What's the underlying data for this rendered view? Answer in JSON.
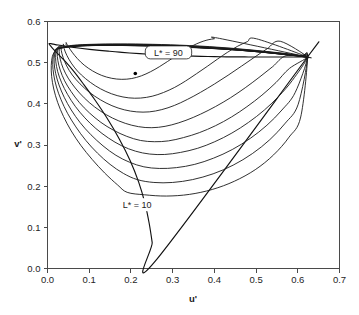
{
  "chart_data": {
    "type": "line",
    "title": "",
    "subtitle": "",
    "xlabel": "u'",
    "ylabel": "v'",
    "xlim": [
      0.0,
      0.7
    ],
    "ylim": [
      0.0,
      0.6
    ],
    "xticks": [
      "0.0",
      "0.1",
      "0.2",
      "0.3",
      "0.4",
      "0.5",
      "0.6",
      "0.7"
    ],
    "xtick_values": [
      0.0,
      0.1,
      0.2,
      0.3,
      0.4,
      0.5,
      0.6,
      0.7
    ],
    "yticks": [
      "0.0",
      "0.1",
      "0.2",
      "0.3",
      "0.4",
      "0.5",
      "0.6"
    ],
    "ytick_values": [
      0.0,
      0.1,
      0.2,
      0.3,
      0.4,
      0.5,
      0.6
    ],
    "grid": false,
    "legend_position": "none",
    "annotations": [
      {
        "name": "lstar-90-label",
        "text": "L* = 90",
        "x": 0.29,
        "y": 0.525,
        "boxed": true
      },
      {
        "name": "lstar-10-label",
        "text": "L* = 10",
        "x": 0.215,
        "y": 0.155,
        "boxed": false
      }
    ],
    "markers": [
      {
        "name": "white-point",
        "x": 0.2105,
        "y": 0.4737,
        "label": ""
      }
    ],
    "series": [
      {
        "name": "spectrum locus",
        "closed": true,
        "u": [
          0.2568,
          0.251,
          0.2436,
          0.2332,
          0.2184,
          0.198,
          0.1721,
          0.1426,
          0.1126,
          0.0852,
          0.0621,
          0.042,
          0.0255,
          0.0139,
          0.0074,
          0.0043,
          0.0041,
          0.0072,
          0.0142,
          0.0252,
          0.0399,
          0.0579,
          0.0785,
          0.1009,
          0.1244,
          0.1485,
          0.1728,
          0.197,
          0.2209,
          0.2443,
          0.2672,
          0.2893,
          0.3106,
          0.3309,
          0.3501,
          0.3681,
          0.3849,
          0.4005,
          0.415,
          0.4284,
          0.4408,
          0.4523,
          0.4629,
          0.4727,
          0.4818,
          0.4903,
          0.4982,
          0.5056,
          0.5125,
          0.519,
          0.5251,
          0.5309,
          0.5364,
          0.5416,
          0.5466,
          0.5514,
          0.556,
          0.5604,
          0.5647,
          0.5688,
          0.5728,
          0.5767,
          0.5805,
          0.5842,
          0.5878,
          0.5913,
          0.5948,
          0.5982,
          0.6015,
          0.6048,
          0.608,
          0.6111,
          0.6142,
          0.6172,
          0.6201,
          0.6229,
          0.6234
        ],
        "v": [
          0.016,
          0.0628,
          0.1105,
          0.16,
          0.2105,
          0.2625,
          0.3148,
          0.3656,
          0.4112,
          0.4494,
          0.48,
          0.5035,
          0.5208,
          0.5329,
          0.5406,
          0.5449,
          0.5466,
          0.5464,
          0.545,
          0.5429,
          0.5404,
          0.5377,
          0.535,
          0.5324,
          0.5299,
          0.5276,
          0.5255,
          0.5236,
          0.5219,
          0.5204,
          0.5191,
          0.518,
          0.5171,
          0.5164,
          0.5158,
          0.5153,
          0.5149,
          0.5146,
          0.5144,
          0.5142,
          0.5141,
          0.514,
          0.5139,
          0.5139,
          0.5138,
          0.5138,
          0.5138,
          0.5138,
          0.5138,
          0.5138,
          0.5138,
          0.5138,
          0.5138,
          0.5138,
          0.5138,
          0.5138,
          0.5138,
          0.5138,
          0.5138,
          0.5138,
          0.5138,
          0.5138,
          0.5138,
          0.5138,
          0.5138,
          0.5138,
          0.5138,
          0.5138,
          0.5138,
          0.5138,
          0.5138,
          0.5138,
          0.5138,
          0.5138,
          0.5138,
          0.5138,
          0.5138
        ]
      },
      {
        "name": "L* = 10",
        "level": 10,
        "closed": true,
        "u": [
          0.0184,
          0.0116,
          0.009,
          0.01,
          0.015,
          0.0245,
          0.0385,
          0.057,
          0.08,
          0.107,
          0.137,
          0.168,
          0.191,
          0.233,
          0.285,
          0.34,
          0.395,
          0.448,
          0.498,
          0.542,
          0.579,
          0.607,
          0.6234,
          0.61,
          0.574,
          0.528,
          0.476,
          0.42,
          0.364,
          0.308,
          0.256,
          0.208,
          0.165,
          0.128,
          0.096,
          0.069,
          0.047,
          0.03,
          0.0184
        ],
        "v": [
          0.53,
          0.515,
          0.493,
          0.466,
          0.436,
          0.403,
          0.369,
          0.334,
          0.299,
          0.265,
          0.232,
          0.203,
          0.185,
          0.179,
          0.176,
          0.18,
          0.192,
          0.212,
          0.24,
          0.276,
          0.319,
          0.368,
          0.5138,
          0.515,
          0.519,
          0.524,
          0.529,
          0.533,
          0.536,
          0.538,
          0.54,
          0.541,
          0.542,
          0.542,
          0.541,
          0.54,
          0.538,
          0.535,
          0.53
        ]
      },
      {
        "name": "L* = 20",
        "level": 20,
        "closed": true,
        "u": [
          0.02,
          0.014,
          0.0125,
          0.015,
          0.0215,
          0.0325,
          0.048,
          0.068,
          0.092,
          0.12,
          0.15,
          0.182,
          0.215,
          0.255,
          0.3,
          0.348,
          0.397,
          0.445,
          0.491,
          0.533,
          0.57,
          0.601,
          0.6234,
          0.606,
          0.567,
          0.52,
          0.468,
          0.413,
          0.358,
          0.304,
          0.253,
          0.206,
          0.164,
          0.128,
          0.097,
          0.071,
          0.05,
          0.033,
          0.02
        ],
        "v": [
          0.532,
          0.517,
          0.496,
          0.47,
          0.441,
          0.41,
          0.377,
          0.344,
          0.311,
          0.28,
          0.253,
          0.231,
          0.216,
          0.209,
          0.209,
          0.216,
          0.23,
          0.251,
          0.279,
          0.313,
          0.353,
          0.399,
          0.5138,
          0.5155,
          0.52,
          0.525,
          0.5295,
          0.5335,
          0.5365,
          0.539,
          0.5405,
          0.5415,
          0.542,
          0.542,
          0.5415,
          0.5405,
          0.5385,
          0.5355,
          0.532
        ]
      },
      {
        "name": "L* = 30",
        "level": 30,
        "closed": true,
        "u": [
          0.0218,
          0.0168,
          0.016,
          0.0195,
          0.0275,
          0.04,
          0.057,
          0.0785,
          0.104,
          0.133,
          0.164,
          0.197,
          0.231,
          0.268,
          0.309,
          0.353,
          0.398,
          0.443,
          0.486,
          0.526,
          0.562,
          0.594,
          0.6234,
          0.603,
          0.562,
          0.514,
          0.462,
          0.408,
          0.354,
          0.301,
          0.251,
          0.205,
          0.164,
          0.128,
          0.098,
          0.072,
          0.051,
          0.034,
          0.0218
        ],
        "v": [
          0.534,
          0.519,
          0.499,
          0.474,
          0.446,
          0.416,
          0.385,
          0.354,
          0.325,
          0.298,
          0.275,
          0.258,
          0.247,
          0.243,
          0.245,
          0.253,
          0.268,
          0.289,
          0.316,
          0.348,
          0.385,
          0.428,
          0.5138,
          0.516,
          0.5205,
          0.5255,
          0.53,
          0.534,
          0.537,
          0.5392,
          0.5408,
          0.5418,
          0.5422,
          0.5422,
          0.5418,
          0.5406,
          0.5388,
          0.536,
          0.534
        ]
      },
      {
        "name": "L* = 40",
        "level": 40,
        "closed": true,
        "u": [
          0.024,
          0.0198,
          0.02,
          0.0245,
          0.034,
          0.048,
          0.0665,
          0.0895,
          0.116,
          0.146,
          0.178,
          0.211,
          0.245,
          0.281,
          0.319,
          0.36,
          0.401,
          0.442,
          0.482,
          0.52,
          0.555,
          0.587,
          0.6234,
          0.6005,
          0.558,
          0.509,
          0.458,
          0.404,
          0.351,
          0.299,
          0.25,
          0.205,
          0.165,
          0.129,
          0.099,
          0.073,
          0.052,
          0.0355,
          0.024
        ],
        "v": [
          0.536,
          0.5215,
          0.502,
          0.478,
          0.451,
          0.423,
          0.394,
          0.366,
          0.34,
          0.317,
          0.298,
          0.285,
          0.278,
          0.277,
          0.282,
          0.292,
          0.308,
          0.329,
          0.355,
          0.385,
          0.419,
          0.457,
          0.5138,
          0.5165,
          0.5212,
          0.5262,
          0.5307,
          0.5345,
          0.5375,
          0.5397,
          0.5412,
          0.5422,
          0.5426,
          0.5425,
          0.542,
          0.5408,
          0.539,
          0.5365,
          0.536
        ]
      },
      {
        "name": "L* = 50",
        "level": 50,
        "closed": true,
        "u": [
          0.0265,
          0.0235,
          0.0248,
          0.0305,
          0.041,
          0.0565,
          0.0765,
          0.1005,
          0.128,
          0.158,
          0.19,
          0.223,
          0.256,
          0.29,
          0.326,
          0.364,
          0.403,
          0.441,
          0.478,
          0.514,
          0.548,
          0.58,
          0.6234,
          0.5985,
          0.5545,
          0.505,
          0.454,
          0.401,
          0.349,
          0.298,
          0.25,
          0.2055,
          0.166,
          0.13,
          0.1,
          0.074,
          0.053,
          0.037,
          0.0265
        ],
        "v": [
          0.538,
          0.524,
          0.505,
          0.482,
          0.456,
          0.43,
          0.403,
          0.378,
          0.355,
          0.336,
          0.321,
          0.311,
          0.308,
          0.31,
          0.318,
          0.33,
          0.347,
          0.368,
          0.393,
          0.421,
          0.452,
          0.486,
          0.5138,
          0.517,
          0.522,
          0.527,
          0.5315,
          0.5352,
          0.5381,
          0.5402,
          0.5417,
          0.5427,
          0.543,
          0.5429,
          0.5423,
          0.5411,
          0.5393,
          0.537,
          0.538
        ]
      },
      {
        "name": "L* = 60",
        "level": 60,
        "closed": true,
        "u": [
          0.0295,
          0.028,
          0.0305,
          0.0375,
          0.0495,
          0.0665,
          0.088,
          0.113,
          0.141,
          0.171,
          0.202,
          0.234,
          0.266,
          0.298,
          0.332,
          0.367,
          0.403,
          0.439,
          0.474,
          0.507,
          0.54,
          0.572,
          0.6234,
          0.5965,
          0.551,
          0.501,
          0.45,
          0.398,
          0.347,
          0.2975,
          0.2505,
          0.2065,
          0.1675,
          0.1315,
          0.1015,
          0.0755,
          0.0545,
          0.0385,
          0.0295
        ],
        "v": [
          0.54,
          0.5268,
          0.5085,
          0.4865,
          0.4625,
          0.4385,
          0.4145,
          0.3925,
          0.3735,
          0.3585,
          0.348,
          0.3425,
          0.343,
          0.349,
          0.36,
          0.375,
          0.3935,
          0.415,
          0.439,
          0.464,
          0.4905,
          0.517,
          0.5138,
          0.5176,
          0.5228,
          0.5278,
          0.5323,
          0.536,
          0.5388,
          0.5409,
          0.5423,
          0.5432,
          0.5435,
          0.5433,
          0.5427,
          0.5415,
          0.5398,
          0.5377,
          0.54
        ]
      },
      {
        "name": "L* = 70",
        "level": 70,
        "closed": true,
        "u": [
          0.033,
          0.033,
          0.0375,
          0.046,
          0.0595,
          0.078,
          0.1005,
          0.1265,
          0.1545,
          0.184,
          0.214,
          0.244,
          0.274,
          0.304,
          0.335,
          0.367,
          0.4,
          0.433,
          0.465,
          0.496,
          0.527,
          0.558,
          0.6234,
          0.5945,
          0.5475,
          0.4975,
          0.4465,
          0.395,
          0.345,
          0.2965,
          0.2505,
          0.2075,
          0.169,
          0.133,
          0.103,
          0.077,
          0.056,
          0.04,
          0.033
        ],
        "v": [
          0.542,
          0.5298,
          0.5125,
          0.492,
          0.47,
          0.4485,
          0.428,
          0.41,
          0.3955,
          0.3855,
          0.3805,
          0.3805,
          0.386,
          0.396,
          0.4105,
          0.428,
          0.448,
          0.4695,
          0.4915,
          0.513,
          0.534,
          0.552,
          0.5138,
          0.5182,
          0.5236,
          0.5287,
          0.5332,
          0.5368,
          0.5396,
          0.5416,
          0.543,
          0.5438,
          0.544,
          0.5438,
          0.5432,
          0.542,
          0.5404,
          0.5385,
          0.542
        ]
      },
      {
        "name": "L* = 80",
        "level": 80,
        "closed": true,
        "u": [
          0.038,
          0.04,
          0.0465,
          0.057,
          0.072,
          0.0915,
          0.1145,
          0.14,
          0.167,
          0.195,
          0.223,
          0.251,
          0.278,
          0.305,
          0.331,
          0.357,
          0.383,
          0.408,
          0.432,
          0.456,
          0.479,
          0.501,
          0.6234,
          0.592,
          0.543,
          0.493,
          0.442,
          0.3915,
          0.3425,
          0.2955,
          0.251,
          0.209,
          0.171,
          0.1355,
          0.1055,
          0.0795,
          0.0585,
          0.0425,
          0.038
        ],
        "v": [
          0.5445,
          0.5335,
          0.5175,
          0.499,
          0.4795,
          0.461,
          0.444,
          0.43,
          0.42,
          0.4145,
          0.414,
          0.4185,
          0.4275,
          0.44,
          0.4555,
          0.473,
          0.491,
          0.509,
          0.5255,
          0.54,
          0.551,
          0.558,
          0.5138,
          0.519,
          0.5246,
          0.5297,
          0.5342,
          0.5378,
          0.5405,
          0.5424,
          0.5437,
          0.5445,
          0.5447,
          0.5445,
          0.5438,
          0.5427,
          0.5412,
          0.5395,
          0.5445
        ]
      },
      {
        "name": "L* = 90",
        "level": 90,
        "closed": true,
        "u": [
          0.045,
          0.05,
          0.059,
          0.0715,
          0.088,
          0.108,
          0.13,
          0.154,
          0.178,
          0.202,
          0.225,
          0.247,
          0.268,
          0.288,
          0.307,
          0.325,
          0.342,
          0.358,
          0.373,
          0.387,
          0.4,
          0.412,
          0.6234,
          0.589,
          0.538,
          0.488,
          0.4375,
          0.388,
          0.34,
          0.2945,
          0.2515,
          0.211,
          0.174,
          0.1395,
          0.1095,
          0.0835,
          0.062,
          0.046,
          0.045
        ],
        "v": [
          0.548,
          0.539,
          0.5255,
          0.51,
          0.494,
          0.48,
          0.469,
          0.462,
          0.4595,
          0.4615,
          0.468,
          0.478,
          0.49,
          0.503,
          0.516,
          0.528,
          0.538,
          0.546,
          0.552,
          0.556,
          0.558,
          0.559,
          0.5138,
          0.52,
          0.5258,
          0.531,
          0.5354,
          0.539,
          0.5416,
          0.5434,
          0.5446,
          0.5453,
          0.5455,
          0.5453,
          0.5447,
          0.5437,
          0.5423,
          0.5408,
          0.548
        ]
      }
    ]
  }
}
